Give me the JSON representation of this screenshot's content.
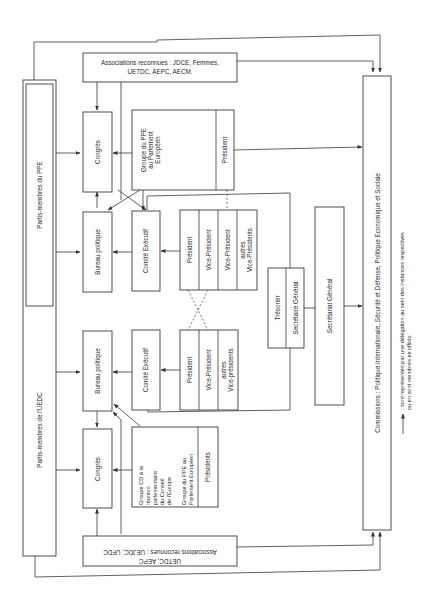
{
  "diagram": {
    "orientation": "rotated 90deg counter-clockwise",
    "left_column": {
      "ppe_members": "Partis-membres du PPE",
      "uedc_members": "Partis-membres de l'UEDC"
    },
    "ppe": {
      "associations": {
        "line1": "Associations reconnues : JDCE, Femmes,",
        "line2": "UETDC, AEPC, AECM."
      },
      "congres": "Congrès",
      "bureau": "Bureau politique",
      "comite": "Comité  Exécutif",
      "groupe_pe": {
        "line1": "Groupe du PPE",
        "line2": "au Parlement",
        "line3": "Européen"
      },
      "groupe_president": "Président",
      "officers": [
        {
          "line1": "Président",
          "line2": ""
        },
        {
          "line1": "Vice-Président",
          "line2": ""
        },
        {
          "line1": "Vice-Président",
          "line2": ""
        },
        {
          "line1": "autres",
          "line2": "Vice-Présidents"
        }
      ]
    },
    "uedc": {
      "associations": {
        "line1": "Associations reconnues : UEJDC, UFDC",
        "line2": "UETDC, AEPC"
      },
      "congres": "Congrès",
      "bureau": "Bureau politique",
      "comite": "Comité  Exécutif",
      "groupe_cd": {
        "line1": "Groupe CD à la",
        "line2": "réunion",
        "line3": "parlementaire",
        "line4": "du Conseil",
        "line5": "de l'Europe"
      },
      "groupe_pe": {
        "line1": "Groupe du PPE au",
        "line2": "Parlement Européen"
      },
      "groupe_presidents": "Présidents",
      "officers": [
        {
          "line1": "Président",
          "line2": ""
        },
        {
          "line1": "Vice-Président",
          "line2": ""
        },
        {
          "line1": "autres",
          "line2": "Vice-présidents"
        }
      ]
    },
    "shared": {
      "tresorier": "Trésorier",
      "secretaire_general": "Secrétaire Général",
      "secretariat_general": "Secrétariat Général",
      "commissions": "Commissions : Politique Internationale, Sécurité et Défense, Politique Economique et Sociale"
    },
    "legend": {
      "line1": ": sont représentés par une délégation au sein des instances respectives",
      "line2": "ou en sont membres ex officio"
    }
  }
}
